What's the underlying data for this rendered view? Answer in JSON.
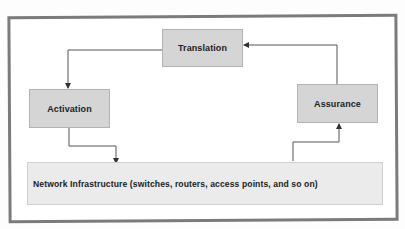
{
  "diagram": {
    "nodes": {
      "translation": {
        "label": "Translation"
      },
      "activation": {
        "label": "Activation"
      },
      "assurance": {
        "label": "Assurance"
      },
      "network": {
        "label": "Network Infrastructure (switches, routers, access points, and so on)"
      }
    },
    "edges": [
      {
        "from": "Translation",
        "to": "Activation"
      },
      {
        "from": "Activation",
        "to": "Network Infrastructure"
      },
      {
        "from": "Network Infrastructure",
        "to": "Assurance"
      },
      {
        "from": "Assurance",
        "to": "Translation"
      }
    ],
    "colors": {
      "frame_border": "#7b7b7b",
      "box_fill": "#d5d5d5",
      "network_fill": "#ebebeb",
      "arrow": "#444444"
    }
  }
}
